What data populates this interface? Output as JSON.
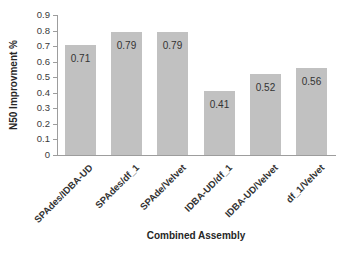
{
  "chart_data": {
    "type": "bar",
    "title": "",
    "xlabel": "Combined Assembly",
    "ylabel": "N50 Improvment %",
    "categories": [
      "SPAdes/IDBA-UD",
      "SPAdes/df_1",
      "SPAde/Velvet",
      "IDBA-UD/df_1",
      "IDBA-UD/Velvet",
      "df_1/Velvet"
    ],
    "values": [
      0.71,
      0.79,
      0.79,
      0.41,
      0.52,
      0.56
    ],
    "data_labels": [
      "0.71",
      "0.79",
      "0.79",
      "0.41",
      "0.52",
      "0.56"
    ],
    "data_label_position": "inside-end",
    "ylim": [
      0,
      0.9
    ],
    "yticks": [
      "0",
      "0.1",
      "0.2",
      "0.3",
      "0.4",
      "0.5",
      "0.6",
      "0.7",
      "0.8",
      "0.9"
    ],
    "grid": false,
    "legend": "none",
    "colors": {
      "bar_fill": "#c1c1c1",
      "axis_line": "#9d9d9d",
      "tick_text": "#3a3a3a",
      "value_text": "#333333",
      "title_text": "#262626",
      "background": "#ffffff"
    }
  }
}
